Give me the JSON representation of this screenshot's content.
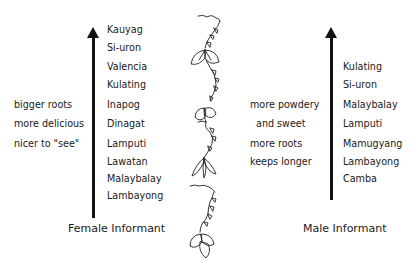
{
  "female": {
    "title": "Female Informant",
    "ranking": [
      "Kauyag",
      "Si-uron",
      "Valencia",
      "Kulating",
      "Inapog",
      "Dinagat",
      "Lamputi",
      "Lawatan",
      "Malaybalay",
      "Lambayong"
    ],
    "criteria": [
      "bigger roots",
      "more delicious",
      "nicer to \"see\""
    ]
  },
  "male": {
    "title": "Male Informant",
    "ranking": [
      "Kulating",
      "Si-uron",
      "Malaybalay",
      "Lamputi",
      "Mamugyang",
      "Lambayong",
      "Camba"
    ],
    "criteria": [
      "more powdery",
      "and sweet",
      "more roots",
      "keeps longer"
    ]
  },
  "illustration": {
    "icon": "sweet-potato-vine-icon"
  },
  "colors": {
    "ink": "#111111",
    "background": "#ffffff"
  }
}
